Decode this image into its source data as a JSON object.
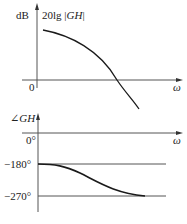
{
  "diagrams": [
    {
      "id": "magnitude",
      "y_unit": "dB",
      "y_label": "20lg |GH|",
      "y_label_prefix": "20lg |",
      "y_label_var": "GH",
      "y_label_suffix": "|",
      "origin_label": "0",
      "x_label": "ω",
      "curve_description": "decreasing magnitude, crosses 0 dB"
    },
    {
      "id": "phase",
      "y_label": "∠GH",
      "y_label_angle": "∠",
      "y_label_var": "GH",
      "x_label": "ω",
      "ticks": [
        "0°",
        "−180°",
        "−270°"
      ],
      "curve_description": "phase from −180° to −270°"
    }
  ],
  "colors": {
    "axis": "#555555",
    "curve": "#1a1a1a",
    "text": "#222222"
  }
}
